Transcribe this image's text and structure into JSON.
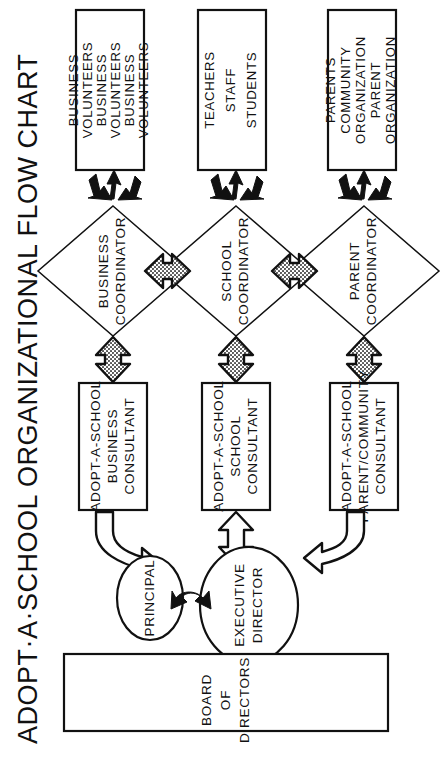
{
  "title": "ADOPT·A·SCHOOL  ORGANIZATIONAL  FLOW CHART",
  "diagram": {
    "type": "organizational-flow-chart",
    "orientation": "rotated-90-counterclockwise",
    "top_boxes": [
      {
        "id": "business-volunteers",
        "lines": [
          "BUSINESS",
          "VOLUNTEERS",
          "BUSINESS",
          "VOLUNTEERS",
          "BUSINESS",
          "VOLUNTEERS"
        ]
      },
      {
        "id": "school-people",
        "lines": [
          "TEACHERS",
          "STAFF",
          "STUDENTS"
        ]
      },
      {
        "id": "parent-community",
        "lines": [
          "PARENTS",
          "COMMUNITY",
          "ORGANIZATION",
          "PARENT",
          "ORGANIZATION"
        ]
      }
    ],
    "coordinators": [
      {
        "id": "business-coordinator",
        "lines": [
          "BUSINESS",
          "COORDINATOR"
        ]
      },
      {
        "id": "school-coordinator",
        "lines": [
          "SCHOOL",
          "COORDINATOR"
        ]
      },
      {
        "id": "parent-coordinator",
        "lines": [
          "PARENT",
          "COORDINATOR"
        ]
      }
    ],
    "consultants": [
      {
        "id": "business-consultant",
        "lines": [
          "ADOPT-A-SCHOOL",
          "BUSINESS",
          "CONSULTANT"
        ]
      },
      {
        "id": "school-consultant",
        "lines": [
          "ADOPT-A-SCHOOL",
          "SCHOOL",
          "CONSULTANT"
        ]
      },
      {
        "id": "parent-community-consultant",
        "lines": [
          "ADOPT-A-SCHOOL",
          "PARENT/COMMUNITY",
          "CONSULTANT"
        ]
      }
    ],
    "circles": [
      {
        "id": "principal",
        "lines": [
          "PRINCIPAL"
        ]
      },
      {
        "id": "executive-director",
        "lines": [
          "EXECUTIVE",
          "DIRECTOR"
        ]
      }
    ],
    "board": {
      "id": "board-of-directors",
      "lines": [
        "BOARD",
        "OF",
        "DIRECTORS"
      ]
    },
    "colors": {
      "ink": "#111111",
      "paper": "#ffffff",
      "stipple": "#b9b9b9"
    }
  }
}
